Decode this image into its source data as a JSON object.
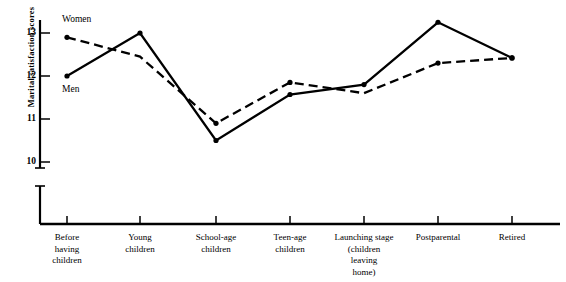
{
  "chart_data": {
    "type": "line",
    "title": "",
    "xlabel": "",
    "ylabel": "Marital satisfaction scores",
    "ylim": [
      9.6,
      13.5
    ],
    "yticks": [
      10,
      11,
      12,
      13
    ],
    "ytick_labels": [
      "10",
      "11",
      "12",
      "13"
    ],
    "axis_break": true,
    "grid": false,
    "legend_position": "inline-left",
    "categories": [
      "Before\nhaving\nchildren",
      "Young\nchildren",
      "School-age\nchildren",
      "Teen-age\nchildren",
      "Launching stage\n(children\nleaving\nhome)",
      "Postparental",
      "Retired"
    ],
    "series": [
      {
        "name": "Women",
        "style": "dashed",
        "values": [
          12.9,
          12.45,
          10.9,
          11.85,
          11.6,
          12.3,
          12.42
        ]
      },
      {
        "name": "Men",
        "style": "solid",
        "values": [
          12.0,
          13.0,
          10.5,
          11.57,
          11.8,
          13.25,
          12.42
        ]
      }
    ],
    "annotations": [
      {
        "text": "Women",
        "series": "Women",
        "anchor": "start-above"
      },
      {
        "text": "Men",
        "series": "Men",
        "anchor": "start-below"
      }
    ],
    "colors": {
      "line": "#000000",
      "axis": "#000000",
      "background": "#ffffff"
    }
  }
}
